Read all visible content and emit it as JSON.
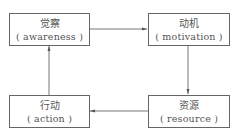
{
  "diagram": {
    "type": "cycle-flowchart",
    "nodes": [
      {
        "id": "awareness",
        "zh": "觉察",
        "en": "( awareness )"
      },
      {
        "id": "motivation",
        "zh": "动机",
        "en": "( motivation )"
      },
      {
        "id": "resource",
        "zh": "资源",
        "en": "( resource )"
      },
      {
        "id": "action",
        "zh": "行动",
        "en": "( action )"
      }
    ],
    "edges": [
      {
        "from": "awareness",
        "to": "motivation"
      },
      {
        "from": "motivation",
        "to": "resource"
      },
      {
        "from": "resource",
        "to": "action"
      },
      {
        "from": "action",
        "to": "awareness"
      }
    ],
    "colors": {
      "stroke": "#666666",
      "text": "#555555",
      "background": "#ffffff"
    }
  }
}
